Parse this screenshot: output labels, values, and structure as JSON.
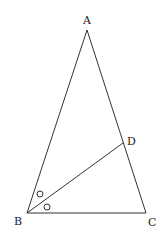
{
  "diagram": {
    "type": "geometry-triangle",
    "points": {
      "A": {
        "label": "A",
        "x": 87,
        "y": 30
      },
      "B": {
        "label": "B",
        "x": 27,
        "y": 213
      },
      "C": {
        "label": "C",
        "x": 146,
        "y": 213
      },
      "D": {
        "label": "D",
        "x": 123,
        "y": 143
      }
    },
    "segments": [
      "AB",
      "AC",
      "BC",
      "BD"
    ],
    "angle_marks": [
      {
        "at": "B",
        "between": [
          "BA",
          "BD"
        ],
        "mark": "circle"
      },
      {
        "at": "B",
        "between": [
          "BD",
          "BC"
        ],
        "mark": "circle"
      }
    ],
    "stroke_color": "#333333"
  }
}
